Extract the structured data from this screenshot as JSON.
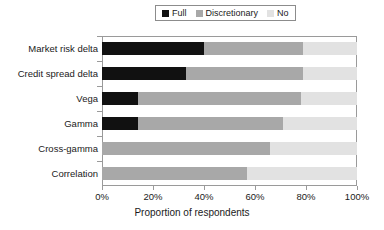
{
  "chart_data": {
    "type": "bar",
    "orientation": "horizontal",
    "stacked": true,
    "stack_mode": "percent",
    "title": "",
    "xlabel": "Proportion of respondents",
    "ylabel": "",
    "xlim": [
      0,
      100
    ],
    "xticks": [
      0,
      20,
      40,
      60,
      80,
      100
    ],
    "xticklabels": [
      "0%",
      "20%",
      "40%",
      "60%",
      "80%",
      "100%"
    ],
    "grid": false,
    "legend_position": "top-center",
    "categories": [
      "Market risk delta",
      "Credit spread delta",
      "Vega",
      "Gamma",
      "Cross-gamma",
      "Correlation"
    ],
    "series": [
      {
        "name": "Full",
        "color": "#111111",
        "values": [
          40,
          33,
          14,
          14,
          0,
          0
        ]
      },
      {
        "name": "Discretionary",
        "color": "#a8a8a8",
        "values": [
          39,
          46,
          64,
          57,
          66,
          57
        ]
      },
      {
        "name": "No",
        "color": "#e2e2e2",
        "values": [
          21,
          21,
          22,
          29,
          34,
          43
        ]
      }
    ]
  },
  "legend": {
    "entries": [
      {
        "label": "Full",
        "color": "#111111"
      },
      {
        "label": "Discretionary",
        "color": "#a8a8a8"
      },
      {
        "label": "No",
        "color": "#e2e2e2"
      }
    ]
  },
  "axis": {
    "x_title": "Proportion of respondents",
    "tick_labels": [
      "0%",
      "20%",
      "40%",
      "60%",
      "80%",
      "100%"
    ]
  },
  "categories": [
    "Market risk delta",
    "Credit spread delta",
    "Vega",
    "Gamma",
    "Cross-gamma",
    "Correlation"
  ]
}
